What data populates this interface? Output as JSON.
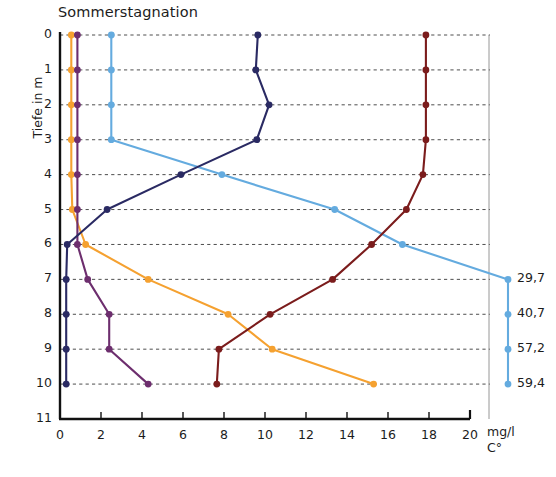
{
  "chart_data": {
    "type": "line",
    "title": "Sommerstagnation",
    "xlabel": "",
    "ylabel": "Tiefe in m",
    "x_unit_lines": [
      "mg/l",
      "C°"
    ],
    "orientation": "depth-profile",
    "grid": true,
    "legend": "none",
    "xlim": [
      0,
      20
    ],
    "ylim": [
      0,
      11
    ],
    "x_ticks": [
      0,
      2,
      4,
      6,
      8,
      10,
      12,
      14,
      16,
      18,
      20
    ],
    "y_ticks": [
      0,
      1,
      2,
      3,
      4,
      5,
      6,
      7,
      8,
      9,
      10,
      11
    ],
    "depths": [
      0,
      1,
      2,
      3,
      4,
      5,
      6,
      7,
      8,
      9,
      10
    ],
    "series": [
      {
        "name": "orange-series",
        "color": "#F5A130",
        "values": [
          0.55,
          0.55,
          0.55,
          0.55,
          0.55,
          0.6,
          1.25,
          4.3,
          8.2,
          10.35,
          15.3
        ]
      },
      {
        "name": "purple-series",
        "color": "#6D2E6E",
        "values": [
          0.85,
          0.85,
          0.85,
          0.85,
          0.85,
          0.85,
          0.85,
          1.35,
          2.4,
          2.4,
          4.3
        ]
      },
      {
        "name": "light-blue-series",
        "color": "#64ABDF",
        "values": [
          2.5,
          2.5,
          2.5,
          2.5,
          7.9,
          13.4,
          16.7,
          null,
          null,
          null,
          null
        ],
        "offscale_values": [
          29.7,
          40.7,
          57.2,
          59.4
        ],
        "offscale_depths": [
          7,
          8,
          9,
          10
        ],
        "offscale_labels": [
          "29,7",
          "40,7",
          "57,2",
          "59,4"
        ]
      },
      {
        "name": "navy-series",
        "color": "#2A2A63",
        "values": [
          9.65,
          9.55,
          10.2,
          9.6,
          5.9,
          2.3,
          0.35,
          0.3,
          0.3,
          0.3,
          0.3
        ]
      },
      {
        "name": "dark-red-series",
        "color": "#7B1C1C",
        "values": [
          17.85,
          17.85,
          17.85,
          17.85,
          17.7,
          16.9,
          15.2,
          13.3,
          10.25,
          7.75,
          7.65
        ]
      }
    ],
    "offscale_note_labels": [
      "29,7",
      "40,7",
      "57,2",
      "59,4"
    ]
  },
  "axis": {
    "y_tick_labels": [
      "0",
      "1",
      "2",
      "3",
      "4",
      "5",
      "6",
      "7",
      "8",
      "9",
      "10",
      "11"
    ],
    "x_tick_labels": [
      "0",
      "2",
      "4",
      "6",
      "8",
      "10",
      "12",
      "14",
      "16",
      "18",
      "20"
    ]
  }
}
